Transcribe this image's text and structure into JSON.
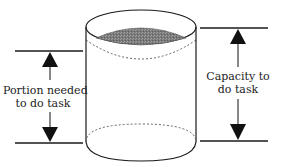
{
  "diagram": {
    "left_label": {
      "line1": "Portion needed",
      "line2": "to do task"
    },
    "right_label": {
      "line1": "Capacity to",
      "line2": "do task"
    },
    "colors": {
      "stroke": "#1a1a1a",
      "fill_liquid": "#8a8a8a",
      "background": "#ffffff"
    }
  }
}
